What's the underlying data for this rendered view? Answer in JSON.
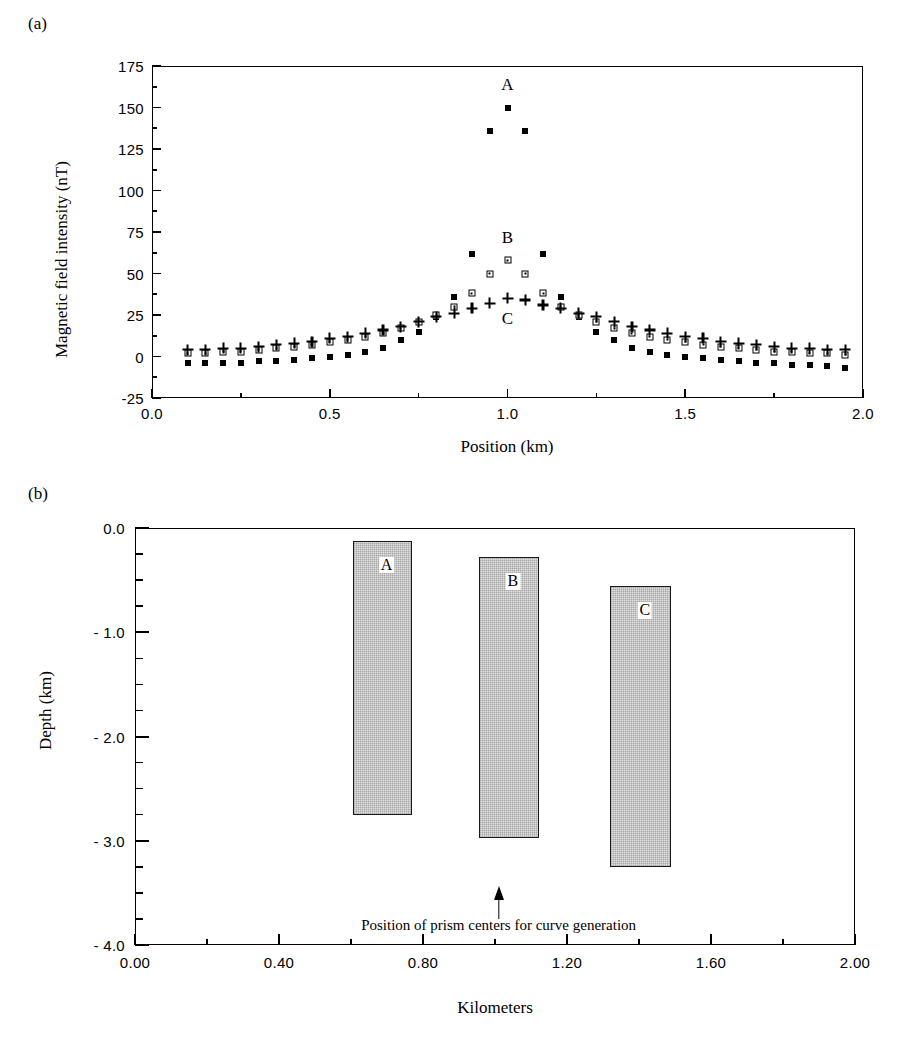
{
  "figure": {
    "panel_a_tag": "(a)",
    "panel_b_tag": "(b)"
  },
  "chart_data": [
    {
      "type": "scatter",
      "panel": "(a)",
      "title": "",
      "xlabel": "Position (km)",
      "ylabel": "Magnetic field intensity (nT)",
      "xlim": [
        0.0,
        2.0
      ],
      "ylim": [
        -25,
        175
      ],
      "xticks": [
        "0.0",
        "0.5",
        "1.0",
        "1.5",
        "2.0"
      ],
      "xtick_values": [
        0.0,
        0.5,
        1.0,
        1.5,
        2.0
      ],
      "yticks": [
        "-25",
        "0",
        "25",
        "50",
        "75",
        "100",
        "125",
        "150",
        "175"
      ],
      "ytick_values": [
        -25,
        0,
        25,
        50,
        75,
        100,
        125,
        150,
        175
      ],
      "grid": false,
      "legend": "inline-annotations",
      "annotations": [
        {
          "text": "A",
          "x": 1.0,
          "y": 163
        },
        {
          "text": "B",
          "x": 1.0,
          "y": 71
        },
        {
          "text": "C",
          "x": 1.0,
          "y": 22
        }
      ],
      "series": [
        {
          "name": "A",
          "marker": "filled-square",
          "x": [
            0.1,
            0.15,
            0.2,
            0.25,
            0.3,
            0.35,
            0.4,
            0.45,
            0.5,
            0.55,
            0.6,
            0.65,
            0.7,
            0.75,
            0.8,
            0.85,
            0.9,
            0.95,
            1.0,
            1.05,
            1.1,
            1.15,
            1.2,
            1.25,
            1.3,
            1.35,
            1.4,
            1.45,
            1.5,
            1.55,
            1.6,
            1.65,
            1.7,
            1.75,
            1.8,
            1.85,
            1.9,
            1.95
          ],
          "y": [
            -4,
            -4,
            -4,
            -4,
            -3,
            -3,
            -2,
            -1,
            0,
            1,
            3,
            5,
            10,
            15,
            24,
            36,
            62,
            136,
            150,
            136,
            62,
            36,
            24,
            15,
            10,
            5,
            3,
            1,
            0,
            -1,
            -2,
            -3,
            -4,
            -4,
            -5,
            -5,
            -6,
            -7
          ]
        },
        {
          "name": "B",
          "marker": "open-square",
          "x": [
            0.1,
            0.15,
            0.2,
            0.25,
            0.3,
            0.35,
            0.4,
            0.45,
            0.5,
            0.55,
            0.6,
            0.65,
            0.7,
            0.75,
            0.8,
            0.85,
            0.9,
            0.95,
            1.0,
            1.05,
            1.1,
            1.15,
            1.2,
            1.25,
            1.3,
            1.35,
            1.4,
            1.45,
            1.5,
            1.55,
            1.6,
            1.65,
            1.7,
            1.75,
            1.8,
            1.85,
            1.9,
            1.95
          ],
          "y": [
            2,
            2,
            3,
            3,
            4,
            5,
            6,
            7,
            9,
            10,
            12,
            14,
            17,
            21,
            25,
            30,
            38,
            50,
            58,
            50,
            38,
            30,
            25,
            21,
            17,
            14,
            12,
            10,
            9,
            7,
            6,
            5,
            4,
            3,
            3,
            2,
            2,
            1
          ]
        },
        {
          "name": "C",
          "marker": "plus",
          "x": [
            0.1,
            0.15,
            0.2,
            0.25,
            0.3,
            0.35,
            0.4,
            0.45,
            0.5,
            0.55,
            0.6,
            0.65,
            0.7,
            0.75,
            0.8,
            0.85,
            0.9,
            0.95,
            1.0,
            1.05,
            1.1,
            1.15,
            1.2,
            1.25,
            1.3,
            1.35,
            1.4,
            1.45,
            1.5,
            1.55,
            1.6,
            1.65,
            1.7,
            1.75,
            1.8,
            1.85,
            1.9,
            1.95
          ],
          "y": [
            4,
            4,
            5,
            5,
            6,
            7,
            8,
            9,
            11,
            12,
            14,
            16,
            18,
            21,
            24,
            26,
            29,
            32,
            35,
            34,
            31,
            29,
            26,
            24,
            21,
            18,
            16,
            14,
            12,
            11,
            9,
            8,
            7,
            6,
            5,
            5,
            4,
            4
          ]
        }
      ]
    },
    {
      "type": "bar",
      "panel": "(b)",
      "title": "",
      "xlabel": "Kilometers",
      "ylabel": "Depth (km)",
      "xlim": [
        0.0,
        2.0
      ],
      "ylim": [
        -4.0,
        0.0
      ],
      "xticks": [
        "0.00",
        "0.40",
        "0.80",
        "1.20",
        "1.60",
        "2.00"
      ],
      "xtick_values": [
        0.0,
        0.4,
        0.8,
        1.2,
        1.6,
        2.0
      ],
      "yticks": [
        "0.0",
        "- 1.0",
        "- 2.0",
        "- 3.0",
        "- 4.0"
      ],
      "ytick_values": [
        0.0,
        -1.0,
        -2.0,
        -3.0,
        -4.0
      ],
      "minor_tick_step": 0.25,
      "grid": false,
      "bars": [
        {
          "label": "A",
          "x_left": 0.605,
          "x_right": 0.77,
          "top": -0.12,
          "bottom": -2.75
        },
        {
          "label": "B",
          "x_left": 0.955,
          "x_right": 1.122,
          "top": -0.28,
          "bottom": -2.97
        },
        {
          "label": "C",
          "x_left": 1.32,
          "x_right": 1.49,
          "top": -0.56,
          "bottom": -3.25
        }
      ],
      "annotations": [
        {
          "text": "Position of prism centers for curve generation",
          "arrow_x": 1.01,
          "arrow_top": -3.43,
          "arrow_bottom": -3.75,
          "text_y": -3.82
        }
      ]
    }
  ]
}
